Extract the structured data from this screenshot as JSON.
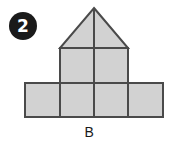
{
  "item": {
    "number": "2",
    "badge_color": "#1a1a1a",
    "badge_text_color": "#ffffff"
  },
  "figure": {
    "label": "B",
    "fill_color": "#d2d2d2",
    "stroke_color": "#4a4a4a",
    "stroke_width": 2,
    "geometry": {
      "unit": 34,
      "grid_origin_x": 25,
      "grid_origin_y": 48,
      "apex": {
        "x": 94,
        "y": 8
      },
      "roof_left": {
        "x": 60,
        "y": 48
      },
      "roof_right": {
        "x": 128,
        "y": 48
      },
      "upper_square": {
        "x": 60,
        "y": 48,
        "width": 68,
        "height": 35
      },
      "bottom_row": {
        "x": 25,
        "y": 83,
        "width": 138,
        "height": 34
      },
      "vertical_dividers": [
        60,
        94,
        128
      ],
      "horizontal_dividers": [
        83
      ],
      "center_line": {
        "x": 94,
        "y_top": 8,
        "y_bottom": 117
      }
    }
  }
}
